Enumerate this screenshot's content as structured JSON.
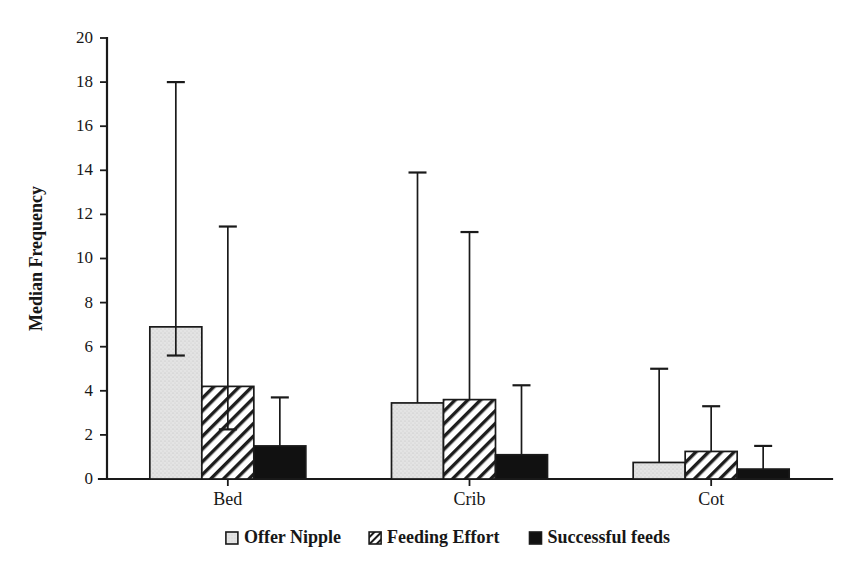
{
  "chart_data": {
    "type": "bar",
    "title": "",
    "subtitle": "",
    "xlabel": "",
    "ylabel": "Median Frequency",
    "categories": [
      "Bed",
      "Crib",
      "Cot"
    ],
    "ylim": [
      0,
      20
    ],
    "yticks": [
      0,
      2,
      4,
      6,
      8,
      10,
      12,
      14,
      16,
      18,
      20
    ],
    "ytick_labels": [
      "0",
      "2",
      "4",
      "6",
      "8",
      "10",
      "12",
      "14",
      "16",
      "18",
      "20"
    ],
    "grid": false,
    "legend_position": "bottom",
    "error_bars": "asymmetric-range",
    "series": [
      {
        "name": "Offer Nipple",
        "fill": "light-gray-stipple",
        "color": "#e2e2e2",
        "values": [
          6.9,
          3.45,
          0.75
        ],
        "err_low": [
          5.6,
          0.0,
          0.0
        ],
        "err_high": [
          18.0,
          13.9,
          5.0
        ]
      },
      {
        "name": "Feeding Effort",
        "fill": "diagonal-hatch",
        "color": "#ffffff",
        "values": [
          4.2,
          3.6,
          1.25
        ],
        "err_low": [
          2.25,
          0.0,
          0.0
        ],
        "err_high": [
          11.45,
          11.2,
          3.3
        ]
      },
      {
        "name": "Successful feeds",
        "fill": "solid-black",
        "color": "#111111",
        "values": [
          1.5,
          1.1,
          0.45
        ],
        "err_low": [
          0.0,
          0.0,
          0.0
        ],
        "err_high": [
          3.7,
          4.25,
          1.5
        ]
      }
    ]
  },
  "legend": {
    "items": [
      {
        "label": "Offer Nipple",
        "swatch": "light-gray-stipple"
      },
      {
        "label": "Feeding Effort",
        "swatch": "diagonal-hatch"
      },
      {
        "label": "Successful feeds",
        "swatch": "solid-black"
      }
    ]
  },
  "axes": {
    "y_title": "Median Frequency"
  }
}
